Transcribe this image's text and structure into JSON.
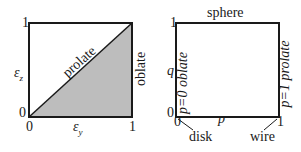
{
  "left_panel": {
    "y_axis_label": "ε",
    "y_axis_sub": "z",
    "x_axis_label": "ε",
    "x_axis_sub": "y",
    "y_tick_top": "1",
    "y_tick_bottom": "0",
    "x_tick_left": "0",
    "x_tick_right": "1",
    "diagonal_label": "prolate",
    "right_edge_label": "oblate",
    "shaded_region_color": "#bdbdbd"
  },
  "right_panel": {
    "top_edge_label": "sphere",
    "y_axis_label": "q",
    "x_axis_label": "p",
    "y_tick_top": "1",
    "y_tick_bottom": "0",
    "x_tick_left": "0",
    "x_tick_right": "1",
    "left_edge_label": "p=0 oblate",
    "right_edge_label": "p=1 prolate",
    "corner_bottom_left": "disk",
    "corner_bottom_right": "wire"
  }
}
